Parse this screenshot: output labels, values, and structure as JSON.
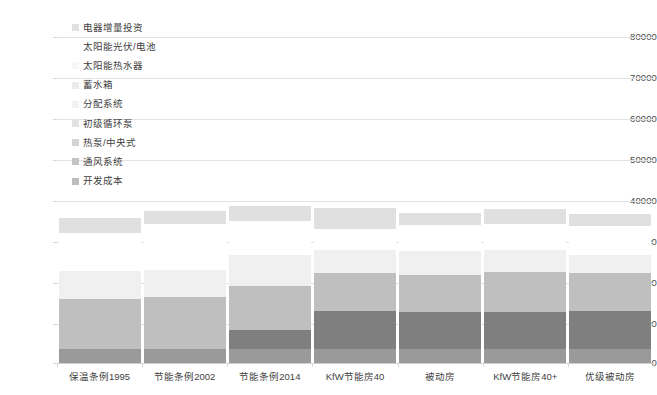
{
  "chart_data": {
    "type": "bar",
    "stacked": true,
    "title": "",
    "xlabel": "",
    "ylabel": "",
    "ylim": [
      0,
      80000
    ],
    "ytick_values": [
      0,
      10000,
      20000,
      30000,
      40000,
      50000,
      60000,
      70000,
      80000
    ],
    "ytick_labels": [
      "0",
      "10000",
      "20000",
      "30000",
      "40000",
      "50000",
      "60000",
      "70000",
      "80000"
    ],
    "grid": true,
    "legend_position": "upper-left-inside",
    "categories": [
      "保温条例1995",
      "节能条例2002",
      "节能条例2014",
      "KfW节能房40",
      "被动房",
      "KfW节能房40+",
      "优级被动房"
    ],
    "series": [
      {
        "name": "开发成本",
        "color": "#9a9a9a",
        "values": [
          3500,
          3500,
          3500,
          3500,
          3500,
          3500,
          3500
        ]
      },
      {
        "name": "通风系统",
        "color": "#7f7f7f",
        "values": [
          0,
          0,
          4500,
          9200,
          9000,
          9000,
          9200
        ]
      },
      {
        "name": "热泵/中央式",
        "color": "#bfbfbf",
        "values": [
          12200,
          12600,
          11000,
          9400,
          9200,
          9800,
          9500
        ]
      },
      {
        "name": "初级循环泵",
        "color": "#d9d9d9",
        "values": [
          0,
          0,
          0,
          0,
          0,
          0,
          0
        ]
      },
      {
        "name": "分配系统",
        "color": "#e2e2e2",
        "values": [
          0,
          0,
          0,
          0,
          0,
          0,
          0
        ]
      },
      {
        "name": "蓄水箱",
        "color": "#ebebeb",
        "values": [
          0,
          0,
          0,
          0,
          0,
          0,
          0
        ]
      },
      {
        "name": "太阳能热水器",
        "color": "#f0f0f0",
        "values": [
          6900,
          6800,
          7600,
          5700,
          5700,
          5500,
          4200
        ]
      },
      {
        "name": "太阳能光伏/电池",
        "color": "#ffffff",
        "values": [
          9200,
          11100,
          8200,
          5200,
          6500,
          6300,
          7300
        ]
      },
      {
        "name": "电器增量投资",
        "color": "#e0e0e0",
        "values": [
          3700,
          3300,
          3700,
          5000,
          2900,
          3600,
          2900
        ]
      }
    ],
    "series_totals": [
      35500,
      37300,
      38500,
      38000,
      36800,
      37700,
      36600
    ]
  },
  "legend": {
    "items": [
      {
        "label": "电器增量投资",
        "color": "#e0e0e0"
      },
      {
        "label": "太阳能光伏/电池",
        "color": "#ffffff"
      },
      {
        "label": "太阳能热水器",
        "color": "#f7f7f7"
      },
      {
        "label": "蓄水箱",
        "color": "#ebebeb"
      },
      {
        "label": "分配系统",
        "color": "#f2f2f2"
      },
      {
        "label": "初级循环泵",
        "color": "#e2e2e2"
      },
      {
        "label": "热泵/中央式",
        "color": "#d4d4d4"
      },
      {
        "label": "通风系统",
        "color": "#c4c4c4"
      },
      {
        "label": "开发成本",
        "color": "#bdbdbd"
      }
    ]
  },
  "colors": {
    "gridline": "#e3e3e3",
    "axis_text": "#4a4a4a",
    "background": "#ffffff"
  }
}
